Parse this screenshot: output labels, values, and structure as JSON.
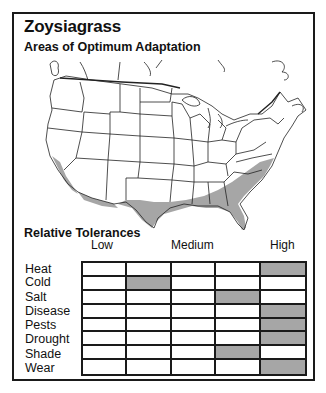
{
  "title": "Zoysiagrass",
  "map": {
    "heading": "Areas of Optimum Adaptation",
    "shaded_region": "Southern U.S.: southern California coast, southern Arizona/New Mexico border, Gulf Coast of Texas and Louisiana, Deep South, Florida, Georgia, Carolinas to Virginia coast",
    "shade_color": "#a6a6a6"
  },
  "tolerances": {
    "heading": "Relative Tolerances",
    "levels": [
      "Low",
      "Medium",
      "High"
    ],
    "columns": 5,
    "rows": [
      {
        "label": "Heat",
        "level": 5
      },
      {
        "label": "Cold",
        "level": 2
      },
      {
        "label": "Salt",
        "level": 4
      },
      {
        "label": "Disease",
        "level": 5
      },
      {
        "label": "Pests",
        "level": 5
      },
      {
        "label": "Drought",
        "level": 5
      },
      {
        "label": "Shade",
        "level": 4
      },
      {
        "label": "Wear",
        "level": 5
      }
    ]
  }
}
